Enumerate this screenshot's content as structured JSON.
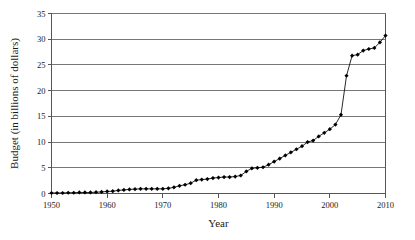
{
  "chart_data": {
    "type": "line",
    "title": "",
    "xlabel": "Year",
    "ylabel": "Budget (in billions of dollars)",
    "xlim": [
      1950,
      2010
    ],
    "ylim": [
      0,
      35
    ],
    "grid": "horizontal",
    "legend": "none",
    "marker": "filled-diamond",
    "xticks": [
      1950,
      1960,
      1970,
      1980,
      1990,
      2000,
      2010
    ],
    "xtick_labels": [
      "1950",
      "1960",
      "1970",
      "1980",
      "1990",
      "2000",
      "2010"
    ],
    "yticks": [
      0,
      5,
      10,
      15,
      20,
      25,
      30,
      35
    ],
    "ytick_labels": [
      "0",
      "5",
      "10",
      "15",
      "20",
      "25",
      "30",
      "35"
    ],
    "x": [
      1950,
      1951,
      1952,
      1953,
      1954,
      1955,
      1956,
      1957,
      1958,
      1959,
      1960,
      1961,
      1962,
      1963,
      1964,
      1965,
      1966,
      1967,
      1968,
      1969,
      1970,
      1971,
      1972,
      1973,
      1974,
      1975,
      1976,
      1977,
      1978,
      1979,
      1980,
      1981,
      1982,
      1983,
      1984,
      1985,
      1986,
      1987,
      1988,
      1989,
      1990,
      1991,
      1992,
      1993,
      1994,
      1995,
      1996,
      1997,
      1998,
      1999,
      2000,
      2001,
      2002,
      2003,
      2004,
      2005,
      2006,
      2007,
      2008,
      2009,
      2010
    ],
    "values": [
      0.1,
      0.1,
      0.1,
      0.15,
      0.15,
      0.2,
      0.2,
      0.2,
      0.25,
      0.3,
      0.4,
      0.45,
      0.6,
      0.7,
      0.8,
      0.85,
      0.9,
      0.9,
      0.9,
      0.9,
      0.9,
      1.0,
      1.2,
      1.5,
      1.7,
      2.0,
      2.6,
      2.7,
      2.8,
      3.0,
      3.1,
      3.2,
      3.2,
      3.3,
      3.5,
      4.3,
      4.9,
      5.0,
      5.1,
      5.6,
      6.2,
      6.8,
      7.4,
      8.0,
      8.6,
      9.2,
      10.0,
      10.3,
      11.1,
      11.8,
      12.5,
      13.4,
      15.3,
      17.6,
      20.1,
      22.9,
      26.8,
      27.1,
      27.8,
      28.0,
      28.5
    ],
    "overrides": {
      "note": "final segment",
      "x_tail": [
        2003,
        2004,
        2005,
        2006,
        2007,
        2008,
        2009,
        2010
      ],
      "values_tail": [
        22.9,
        26.8,
        27.0,
        27.8,
        28.1,
        28.3,
        29.4,
        30.7
      ]
    },
    "colors": {
      "line": "#111111",
      "marker": "#000000",
      "grid": "#777777",
      "axis": "#555555",
      "background": "#ffffff",
      "text": "#1a1a1a"
    }
  }
}
